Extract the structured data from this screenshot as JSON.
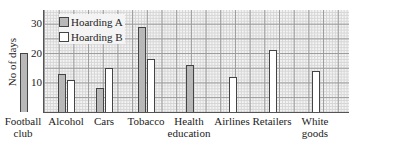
{
  "chart_data": {
    "type": "bar",
    "title": "",
    "xlabel": "",
    "ylabel": "No of days",
    "ylim": [
      0,
      35
    ],
    "yticks": [
      10,
      20,
      30
    ],
    "grid": true,
    "legend_position": "top-left inside",
    "categories": [
      "Football club",
      "Alcohol",
      "Cars",
      "Tobacco",
      "Health education",
      "Airlines",
      "Retailers",
      "White goods"
    ],
    "series": [
      {
        "name": "Hoarding A",
        "color": "#b8b8b8",
        "values": [
          20,
          13,
          8,
          29,
          16,
          null,
          null,
          null
        ]
      },
      {
        "name": "Hoarding B",
        "color": "#ffffff",
        "values": [
          null,
          11,
          15,
          18,
          null,
          12,
          21,
          14
        ]
      }
    ]
  },
  "labels": {
    "ylabel": "No of days",
    "yticks": [
      "30",
      "20",
      "10"
    ],
    "legend": [
      "Hoarding A",
      "Hoarding B"
    ],
    "categories": [
      [
        "Football",
        "club"
      ],
      [
        "Alcohol",
        ""
      ],
      [
        "Cars",
        ""
      ],
      [
        "Tobacco",
        ""
      ],
      [
        "Health",
        "education"
      ],
      [
        "Airlines",
        ""
      ],
      [
        "Retailers",
        ""
      ],
      [
        "White",
        "goods"
      ]
    ]
  }
}
